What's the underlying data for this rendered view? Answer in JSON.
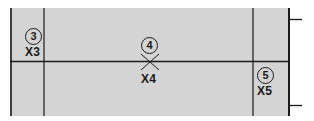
{
  "diagram": {
    "background_color": "#d4d4d4",
    "line_color": "#1a1a1a",
    "markers": [
      {
        "number": "3",
        "code": "X3"
      },
      {
        "number": "4",
        "code": "X4"
      },
      {
        "number": "5",
        "code": "X5"
      }
    ]
  }
}
